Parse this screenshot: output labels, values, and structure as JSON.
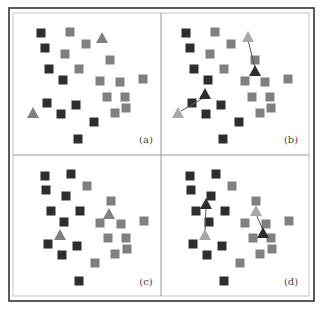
{
  "figure": {
    "colors": {
      "dark": "#2e2e2e",
      "gray": "#808080",
      "light": "#a8a8a8",
      "frame": "#333333",
      "inner_frame": "#bdbdbd",
      "divider": "#9a9a9a"
    },
    "panels": [
      {
        "label": "(a)",
        "offset": [
          0,
          0
        ],
        "label_pos": [
          146,
          143
        ],
        "dark_squares": [
          [
            41,
            33
          ],
          [
            45,
            48
          ],
          [
            49,
            69
          ],
          [
            63,
            80
          ],
          [
            47,
            103
          ],
          [
            76,
            105
          ],
          [
            61,
            114
          ],
          [
            94,
            122
          ],
          [
            78,
            139
          ]
        ],
        "gray_squares": [
          [
            70,
            32
          ],
          [
            86,
            44
          ],
          [
            65,
            54
          ],
          [
            79,
            69
          ],
          [
            110,
            60
          ],
          [
            100,
            81
          ],
          [
            120,
            82
          ],
          [
            143,
            79
          ],
          [
            107,
            97
          ],
          [
            125,
            97
          ],
          [
            126,
            108
          ],
          [
            115,
            113
          ]
        ],
        "triangles": [
          {
            "x": 102,
            "y": 38,
            "tone": "gray"
          },
          {
            "x": 33,
            "y": 113,
            "tone": "gray"
          }
        ],
        "arrows": []
      },
      {
        "label": "(b)",
        "offset": [
          145,
          0
        ],
        "label_pos": [
          146,
          143
        ],
        "dark_squares": [
          [
            41,
            33
          ],
          [
            45,
            48
          ],
          [
            49,
            69
          ],
          [
            63,
            80
          ],
          [
            47,
            103
          ],
          [
            76,
            105
          ],
          [
            61,
            114
          ],
          [
            94,
            122
          ],
          [
            78,
            139
          ]
        ],
        "gray_squares": [
          [
            70,
            32
          ],
          [
            86,
            44
          ],
          [
            65,
            54
          ],
          [
            79,
            69
          ],
          [
            110,
            60
          ],
          [
            100,
            81
          ],
          [
            120,
            82
          ],
          [
            143,
            79
          ],
          [
            107,
            97
          ],
          [
            125,
            97
          ],
          [
            126,
            108
          ],
          [
            115,
            113
          ]
        ],
        "triangles": [
          {
            "x": 103,
            "y": 37,
            "tone": "light"
          },
          {
            "x": 110,
            "y": 71,
            "tone": "dark"
          },
          {
            "x": 60,
            "y": 94,
            "tone": "dark"
          },
          {
            "x": 33,
            "y": 113,
            "tone": "light"
          }
        ],
        "arrows": [
          [
            103,
            40,
            110,
            68
          ],
          [
            60,
            97,
            36,
            111
          ]
        ]
      },
      {
        "label": "(c)",
        "offset": [
          0,
          0
        ],
        "label_pos": [
          146,
          285
        ],
        "dark_squares": [
          [
            45,
            176
          ],
          [
            71,
            174
          ],
          [
            46,
            190
          ],
          [
            66,
            196
          ],
          [
            51,
            211
          ],
          [
            80,
            211
          ],
          [
            64,
            222
          ],
          [
            48,
            244
          ],
          [
            77,
            246
          ],
          [
            62,
            255
          ],
          [
            79,
            281
          ]
        ],
        "gray_squares": [
          [
            87,
            186
          ],
          [
            111,
            201
          ],
          [
            100,
            223
          ],
          [
            121,
            224
          ],
          [
            144,
            221
          ],
          [
            108,
            238
          ],
          [
            126,
            238
          ],
          [
            127,
            249
          ],
          [
            115,
            254
          ],
          [
            95,
            263
          ]
        ],
        "triangles": [
          {
            "x": 109,
            "y": 214,
            "tone": "gray"
          },
          {
            "x": 60,
            "y": 235,
            "tone": "gray"
          }
        ],
        "arrows": []
      },
      {
        "label": "(d)",
        "offset": [
          145,
          0
        ],
        "label_pos": [
          146,
          285
        ],
        "dark_squares": [
          [
            45,
            176
          ],
          [
            71,
            174
          ],
          [
            46,
            190
          ],
          [
            66,
            196
          ],
          [
            51,
            211
          ],
          [
            80,
            211
          ],
          [
            64,
            222
          ],
          [
            48,
            244
          ],
          [
            77,
            246
          ],
          [
            62,
            255
          ],
          [
            79,
            281
          ]
        ],
        "gray_squares": [
          [
            87,
            186
          ],
          [
            111,
            201
          ],
          [
            100,
            223
          ],
          [
            121,
            224
          ],
          [
            144,
            221
          ],
          [
            108,
            238
          ],
          [
            126,
            238
          ],
          [
            127,
            249
          ],
          [
            115,
            254
          ],
          [
            95,
            263
          ]
        ],
        "triangles": [
          {
            "x": 111,
            "y": 211,
            "tone": "light"
          },
          {
            "x": 118,
            "y": 233,
            "tone": "dark"
          },
          {
            "x": 60,
            "y": 235,
            "tone": "light"
          },
          {
            "x": 61,
            "y": 204,
            "tone": "dark"
          }
        ],
        "arrows": [
          [
            111,
            214,
            118,
            230
          ],
          [
            60,
            232,
            61,
            207
          ]
        ]
      }
    ]
  }
}
